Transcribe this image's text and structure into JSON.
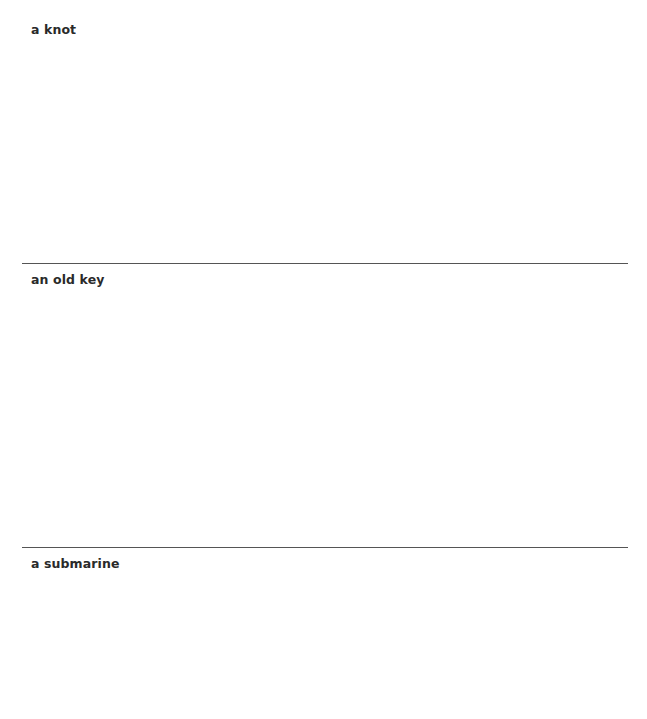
{
  "sections": [
    {
      "label": "a knot"
    },
    {
      "label": "an old key"
    },
    {
      "label": "a submarine"
    }
  ]
}
